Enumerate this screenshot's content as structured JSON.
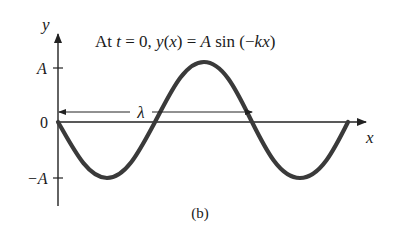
{
  "figure": {
    "title_prefix": "At ",
    "title_t": "t",
    "title_eq0": " = 0, ",
    "title_y": "y",
    "title_paren_x_open": "(",
    "title_x": "x",
    "title_paren_x_close": ") = ",
    "title_A": "A",
    "title_sin": " sin (−",
    "title_k": "k",
    "title_x2": "x",
    "title_close": ")",
    "caption": "(b)"
  },
  "axes": {
    "y_label": "y",
    "x_label": "x",
    "ticks": {
      "top": "A",
      "zero": "0",
      "bottom": "−A"
    }
  },
  "annotation": {
    "wavelength_label": "λ"
  },
  "colors": {
    "curve": "#3a3a3a",
    "axis": "#222222",
    "text": "#1a1a1a"
  }
}
